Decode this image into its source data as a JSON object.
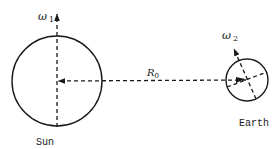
{
  "diagram": {
    "sun": {
      "label": "Sun",
      "omega_label": "ω",
      "omega_sub": "1"
    },
    "earth": {
      "label": "Earth",
      "omega_label": "ω",
      "omega_sub": "2"
    },
    "distance": {
      "label": "R",
      "sub": "0"
    },
    "colors": {
      "stroke": "#1a1a1a",
      "background": "#ffffff"
    }
  }
}
